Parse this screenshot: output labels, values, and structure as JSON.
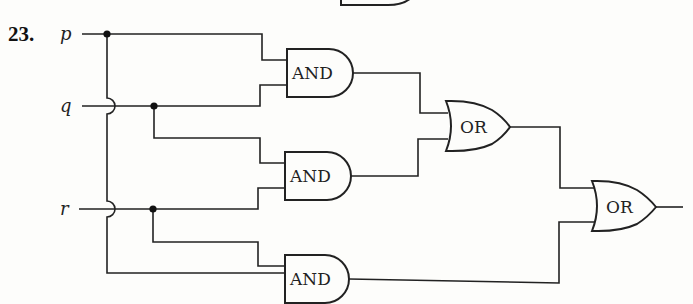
{
  "problem": {
    "number": "23.",
    "inputs": [
      {
        "name": "p",
        "y": 34
      },
      {
        "name": "q",
        "y": 106
      },
      {
        "name": "r",
        "y": 209
      }
    ],
    "gates": [
      {
        "id": "and1",
        "type": "AND",
        "label": "AND",
        "inputs": [
          "p",
          "q"
        ]
      },
      {
        "id": "and2",
        "type": "AND",
        "label": "AND",
        "inputs": [
          "q",
          "r"
        ]
      },
      {
        "id": "and3",
        "type": "AND",
        "label": "AND",
        "inputs": [
          "r",
          "p"
        ]
      },
      {
        "id": "or1",
        "type": "OR",
        "label": "OR",
        "inputs": [
          "and1",
          "and2"
        ]
      },
      {
        "id": "or2",
        "type": "OR",
        "label": "OR",
        "inputs": [
          "or1",
          "and3"
        ]
      }
    ],
    "output_expression": "(p AND q) OR (q AND r) OR (r AND p)"
  },
  "colors": {
    "ink": "#222222",
    "paper": "#fdfdfb"
  }
}
